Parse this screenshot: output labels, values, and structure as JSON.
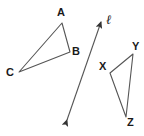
{
  "figure": {
    "background_color": "#ffffff",
    "stroke_color": "#555555",
    "label_color": "#1a1a1a",
    "width": 144,
    "height": 136
  },
  "labels": {
    "A": "A",
    "B": "B",
    "C": "C",
    "X": "X",
    "Y": "Y",
    "Z": "Z",
    "line": "ℓ"
  },
  "shapes": {
    "triangle_abc": {
      "name": "triangle ABC",
      "vertices": [
        {
          "label": "A",
          "x": 62,
          "y": 23
        },
        {
          "label": "B",
          "x": 70,
          "y": 52
        },
        {
          "label": "C",
          "x": 19,
          "y": 72
        }
      ],
      "points_attr": "62,23 70,52 19,72"
    },
    "triangle_xyz": {
      "name": "triangle XYZ",
      "vertices": [
        {
          "label": "X",
          "x": 110,
          "y": 73
        },
        {
          "label": "Y",
          "x": 133,
          "y": 54
        },
        {
          "label": "Z",
          "x": 126,
          "y": 117
        }
      ],
      "points_attr": "110,73 133,54 126,117"
    },
    "line_ell": {
      "name": "line ℓ",
      "x1": 67,
      "y1": 120,
      "x2": 101,
      "y2": 22,
      "double_arrow": true
    }
  }
}
